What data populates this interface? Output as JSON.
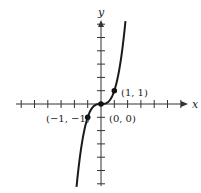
{
  "chart_data": {
    "type": "line",
    "title": "",
    "function": "y = x^3",
    "xlabel": "x",
    "ylabel": "y",
    "xlim": [
      -6.4,
      6.5
    ],
    "ylim": [
      -6.2,
      6.2
    ],
    "x_ticks": [
      -6,
      -5,
      -4,
      -3,
      -2,
      -1,
      1,
      2,
      3,
      4,
      5,
      6
    ],
    "y_ticks": [
      -6,
      -5,
      -4,
      -3,
      -2,
      -1,
      1,
      2,
      3,
      4,
      5,
      6
    ],
    "tick_labels_shown": false,
    "grid": false,
    "series": [
      {
        "name": "y = x^3",
        "x": [
          -1.83,
          -1.5,
          -1.25,
          -1,
          -0.75,
          -0.5,
          0,
          0.5,
          0.75,
          1,
          1.25,
          1.5,
          1.83
        ],
        "y": [
          -6.13,
          -3.375,
          -1.95,
          -1,
          -0.42,
          -0.125,
          0,
          0.125,
          0.42,
          1,
          1.95,
          3.375,
          6.13
        ]
      }
    ],
    "points": [
      {
        "x": -1,
        "y": -1,
        "label": "(−1, −1)"
      },
      {
        "x": 0,
        "y": 0,
        "label": "(0, 0)"
      },
      {
        "x": 1,
        "y": 1,
        "label": "(1, 1)"
      }
    ]
  },
  "labels": {
    "x_axis": "x",
    "y_axis": "y",
    "point_neg": "(−1, −1)",
    "point_origin": "(0, 0)",
    "point_pos": "(1, 1)"
  },
  "colors": {
    "axis": "#333333",
    "curve": "#1a1a1a",
    "background": "#ffffff"
  }
}
